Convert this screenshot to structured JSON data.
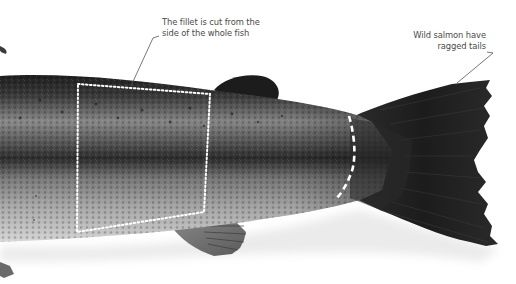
{
  "image": {
    "subject": "salmon",
    "description": "Photograph of the rear half of a whole wild salmon with annotations showing where the fillet is cut and the ragged tail"
  },
  "annotations": {
    "fillet": {
      "line1": "The fillet is cut from the",
      "line2": "side of the whole fish"
    },
    "tail": {
      "line1": "Wild salmon have",
      "line2": "ragged tails"
    }
  },
  "overlays": {
    "fillet_outline": {
      "style": "dotted",
      "color": "#ffffff"
    },
    "tail_cut_line": {
      "style": "dashed",
      "color": "#ffffff"
    },
    "leader_line_color": "#555555"
  },
  "colors": {
    "background": "#ffffff",
    "fish_back": "#2a2a2a",
    "fish_belly": "#c8c8c8",
    "tail": "#1e1e1e",
    "label_text": "#4a4a4a"
  }
}
